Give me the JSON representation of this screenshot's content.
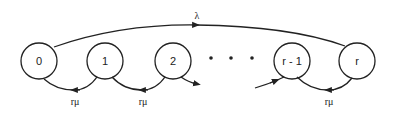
{
  "diagram": {
    "type": "state-transition",
    "nodes": [
      {
        "id": "n0",
        "label": "0",
        "cx": 39,
        "cy": 61
      },
      {
        "id": "n1",
        "label": "1",
        "cx": 105,
        "cy": 61
      },
      {
        "id": "n2",
        "label": "2",
        "cx": 173,
        "cy": 61
      },
      {
        "id": "nr1",
        "label": "r - 1",
        "cx": 292,
        "cy": 61
      },
      {
        "id": "nr",
        "label": "r",
        "cx": 357,
        "cy": 61
      }
    ],
    "ellipsis": "• • •",
    "edges": {
      "top_arc": {
        "from": "0",
        "to": "r",
        "label": "λ"
      },
      "bottom_arcs": [
        {
          "from": "1",
          "to": "0",
          "label": "rμ"
        },
        {
          "from": "2",
          "to": "1",
          "label": "rμ"
        },
        {
          "from": "r",
          "to": "r - 1",
          "label": "rμ"
        }
      ],
      "stubs": [
        {
          "from": "2",
          "to": "…"
        },
        {
          "from": "…",
          "to": "r - 1"
        }
      ]
    },
    "colors": {
      "stroke": "#222222",
      "background": "#ffffff"
    }
  }
}
